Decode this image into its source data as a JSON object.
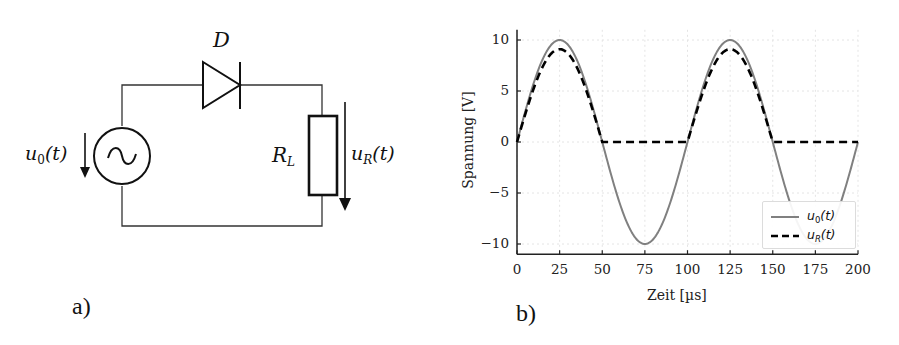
{
  "panel_a": {
    "caption": "a)",
    "diode_label": "D",
    "source_voltage_label": {
      "base": "u",
      "sub": "0",
      "arg": "(t)"
    },
    "resistor_label": {
      "base": "R",
      "sub": "L"
    },
    "resistor_voltage_label": {
      "base": "u",
      "sub": "R",
      "arg": "(t)"
    },
    "components": [
      "ac-voltage-source",
      "diode",
      "load-resistor"
    ],
    "colors": {
      "wire": "#333333",
      "symbol": "#111111"
    }
  },
  "panel_b": {
    "caption": "b)",
    "legend": [
      {
        "base": "u",
        "sub": "0",
        "arg": "(t)",
        "style": "solid",
        "color": "#808080"
      },
      {
        "base": "u",
        "sub": "R",
        "arg": "(t)",
        "style": "dashed",
        "color": "#000000"
      }
    ]
  },
  "chart_data": {
    "type": "line",
    "title": "",
    "xlabel": "Zeit [µs]",
    "ylabel": "Spannung [V]",
    "xlim": [
      0,
      200
    ],
    "ylim": [
      -11,
      11
    ],
    "xticks": [
      0,
      25,
      50,
      75,
      100,
      125,
      150,
      175,
      200
    ],
    "xtick_labels": [
      "0",
      "25",
      "50",
      "75",
      "100",
      "125",
      "150",
      "175",
      "200"
    ],
    "yticks": [
      -10,
      -5,
      0,
      5,
      10
    ],
    "ytick_labels": [
      "−10",
      "−5",
      "0",
      "5",
      "10"
    ],
    "grid": true,
    "legend_position": "lower right",
    "series": [
      {
        "name": "u0(t)",
        "style": "solid",
        "color": "#808080",
        "x": [
          0,
          12.5,
          25,
          37.5,
          50,
          62.5,
          75,
          87.5,
          100,
          112.5,
          125,
          137.5,
          150,
          162.5,
          175,
          187.5,
          200
        ],
        "y": [
          0,
          7.07,
          10,
          7.07,
          0,
          -7.07,
          -10,
          -7.07,
          0,
          7.07,
          10,
          7.07,
          0,
          -7.07,
          -10,
          -7.07,
          0
        ],
        "formula": "10*sin(2*pi*t/100)"
      },
      {
        "name": "uR(t)",
        "style": "dashed",
        "color": "#000000",
        "x": [
          0,
          12.5,
          25,
          37.5,
          50,
          75,
          100,
          112.5,
          125,
          137.5,
          150,
          175,
          200
        ],
        "y": [
          0,
          6.4,
          9.1,
          6.4,
          0,
          0,
          0,
          6.4,
          9.1,
          6.4,
          0,
          0,
          0
        ],
        "note": "half-wave rectified; peak ~9.1 V (diode drop ~0.9 V)"
      }
    ]
  }
}
